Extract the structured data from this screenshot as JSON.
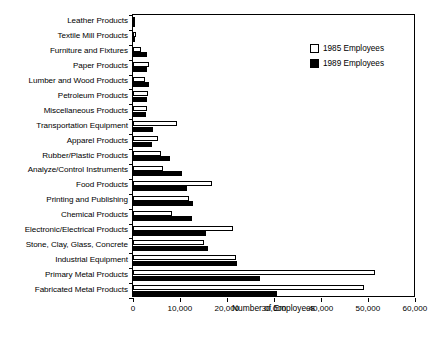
{
  "chart_data": {
    "type": "bar",
    "orientation": "horizontal",
    "title": "",
    "xlabel": "Number of Employees",
    "ylabel": "",
    "xlim": [
      0,
      60000
    ],
    "xticks": [
      0,
      10000,
      20000,
      30000,
      40000,
      50000,
      60000
    ],
    "xtick_labels": [
      "0",
      "10,000",
      "20,000",
      "30,000",
      "40,000",
      "50,000",
      "60,000"
    ],
    "grid": false,
    "legend_position": "top-right",
    "categories": [
      "Leather Products",
      "Textile Mill Products",
      "Furniture and Fixtures",
      "Paper Products",
      "Lumber and Wood Products",
      "Petroleum Products",
      "Miscellaneous Products",
      "Transportation Equipment",
      "Apparel Products",
      "Rubber/Plastic Products",
      "Analyze/Control Instruments",
      "Food Products",
      "Printing and Publishing",
      "Chemical Products",
      "Electronic/Electrical Products",
      "Stone, Clay, Glass, Concrete",
      "Industrial Equipment",
      "Primary Metal Products",
      "Fabricated Metal Products"
    ],
    "series": [
      {
        "name": "1985 Employees",
        "color": "#ffffff",
        "edge_color": "#000000",
        "values": [
          200,
          600,
          1800,
          3300,
          2600,
          3100,
          3000,
          9300,
          5400,
          6000,
          6400,
          16800,
          12000,
          8300,
          21300,
          15000,
          22000,
          51500,
          49200
        ]
      },
      {
        "name": "1989 Employees",
        "color": "#000000",
        "edge_color": "#000000",
        "values": [
          150,
          500,
          2900,
          3000,
          3400,
          2900,
          2700,
          4300,
          4000,
          7900,
          10400,
          11500,
          12700,
          12600,
          15500,
          16000,
          22200,
          27000,
          30600
        ]
      }
    ]
  },
  "legend": {
    "entries": [
      {
        "label": "1985 Employees",
        "swatch": "white-square"
      },
      {
        "label": "1989 Employees",
        "swatch": "black-square"
      }
    ]
  },
  "axis": {
    "x_title": "Number of Employees"
  }
}
